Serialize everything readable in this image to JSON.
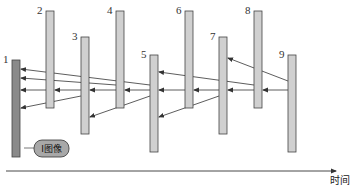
{
  "diagram": {
    "time_axis_label": "时间",
    "callout_label": "I图像",
    "colors": {
      "i_frame_fill": "#8a8a8a",
      "frame_fill": "#d0d0d0",
      "frame_stroke": "#444444",
      "arrow": "#333333",
      "callout_fill": "#a8a8a8"
    },
    "frames": [
      {
        "id": "1",
        "label": "1",
        "type": "I",
        "x": 16,
        "top": 60,
        "bottom": 157
      },
      {
        "id": "2",
        "label": "2",
        "type": "P",
        "x": 50,
        "top": 11,
        "bottom": 108
      },
      {
        "id": "3",
        "label": "3",
        "type": "P",
        "x": 85,
        "top": 37,
        "bottom": 134
      },
      {
        "id": "4",
        "label": "4",
        "type": "P",
        "x": 120,
        "top": 11,
        "bottom": 108
      },
      {
        "id": "5",
        "label": "5",
        "type": "P",
        "x": 154,
        "top": 55,
        "bottom": 152
      },
      {
        "id": "6",
        "label": "6",
        "type": "P",
        "x": 189,
        "top": 11,
        "bottom": 108
      },
      {
        "id": "7",
        "label": "7",
        "type": "P",
        "x": 223,
        "top": 37,
        "bottom": 134
      },
      {
        "id": "8",
        "label": "8",
        "type": "P",
        "x": 258,
        "top": 11,
        "bottom": 108
      },
      {
        "id": "9",
        "label": "9",
        "type": "P",
        "x": 292,
        "top": 55,
        "bottom": 152
      }
    ],
    "references": [
      {
        "from": "3",
        "to": "1",
        "y1": 96,
        "y2": 108
      },
      {
        "from": "2",
        "to": "1",
        "y1": 90,
        "y2": 90
      },
      {
        "from": "3",
        "to": "2",
        "y1": 90,
        "y2": 90
      },
      {
        "from": "5",
        "to": "1",
        "y1": 85,
        "y2": 69
      },
      {
        "from": "4",
        "to": "1",
        "y1": 85,
        "y2": 78
      },
      {
        "from": "4",
        "to": "3",
        "y1": 90,
        "y2": 90
      },
      {
        "from": "5",
        "to": "3",
        "y1": 96,
        "y2": 117
      },
      {
        "from": "5",
        "to": "4",
        "y1": 90,
        "y2": 90
      },
      {
        "from": "7",
        "to": "5",
        "y1": 96,
        "y2": 117
      },
      {
        "from": "6",
        "to": "5",
        "y1": 90,
        "y2": 90
      },
      {
        "from": "8",
        "to": "5",
        "y1": 85,
        "y2": 72
      },
      {
        "from": "7",
        "to": "6",
        "y1": 90,
        "y2": 90
      },
      {
        "from": "8",
        "to": "7",
        "y1": 90,
        "y2": 90
      },
      {
        "from": "9",
        "to": "8",
        "y1": 90,
        "y2": 90
      },
      {
        "from": "9",
        "to": "7",
        "y1": 81,
        "y2": 58
      }
    ]
  }
}
